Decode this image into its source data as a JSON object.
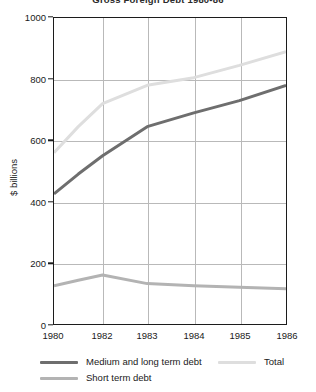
{
  "chart_data": {
    "type": "line",
    "title": "Gross Foreign Debt 1980-86",
    "xlabel": "",
    "ylabel": "$ billions",
    "ylim": [
      0,
      1000
    ],
    "yticks": [
      0,
      200,
      400,
      600,
      800,
      1000
    ],
    "xticks": [
      "1980",
      "1982",
      "1983",
      "1984",
      "1985",
      "1986"
    ],
    "x": [
      1980,
      1981,
      1982,
      1983,
      1984,
      1985,
      1986
    ],
    "grid": true,
    "legend_position": "bottom",
    "series": [
      {
        "name": "Medium and long term debt",
        "color": "#6e6e6e",
        "values": [
          425,
          490,
          550,
          645,
          690,
          730,
          780
        ]
      },
      {
        "name": "Short term debt",
        "color": "#b3b3b3",
        "values": [
          125,
          143,
          160,
          132,
          125,
          120,
          115
        ]
      },
      {
        "name": "Total",
        "color": "#dedede",
        "values": [
          560,
          645,
          720,
          780,
          805,
          845,
          890
        ]
      }
    ]
  },
  "axes": {
    "frame_color": "#1c1c1c",
    "grid_color": "#b9b9b9"
  }
}
